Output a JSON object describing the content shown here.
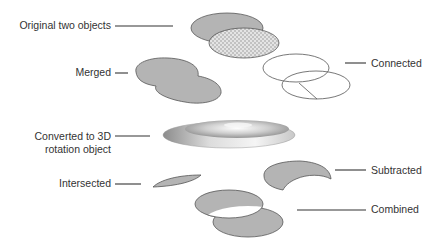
{
  "labels": {
    "original": "Original two objects",
    "merged": "Merged",
    "converted_line1": "Converted to 3D",
    "converted_line2": "rotation object",
    "intersected": "Intersected",
    "connected": "Connected",
    "subtracted": "Subtracted",
    "combined": "Combined"
  },
  "colors": {
    "fill": "#b4b4b4",
    "stroke": "#555555",
    "text": "#333333",
    "line": "#333333"
  }
}
